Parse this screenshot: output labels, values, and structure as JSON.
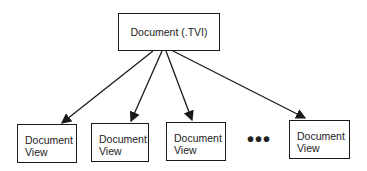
{
  "diagram": {
    "root": {
      "label": "Document (.TVI)"
    },
    "children": [
      {
        "line1": "Document",
        "line2": "View"
      },
      {
        "line1": "Document",
        "line2": "View"
      },
      {
        "line1": "Document",
        "line2": "View"
      },
      {
        "line1": "Document",
        "line2": "View"
      }
    ],
    "ellipsis": "•••",
    "colors": {
      "stroke": "#1a1a1a",
      "text": "#222222",
      "background": "#ffffff"
    }
  }
}
